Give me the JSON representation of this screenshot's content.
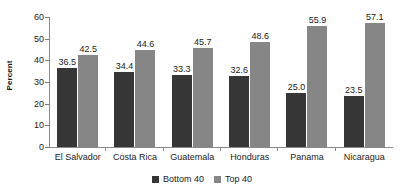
{
  "chart_data": {
    "type": "bar",
    "title": "",
    "subtitle": "",
    "xlabel": "",
    "ylabel": "Percent",
    "ylim": [
      0,
      60
    ],
    "yticks": [
      0,
      10,
      20,
      30,
      40,
      50,
      60
    ],
    "grid": false,
    "legend_position": "bottom",
    "categories": [
      "El Salvador",
      "Costa Rica",
      "Guatemala",
      "Honduras",
      "Panama",
      "Nicaragua"
    ],
    "series": [
      {
        "name": "Bottom 40",
        "color": "#363636",
        "values": [
          36.5,
          34.4,
          33.3,
          32.6,
          25.0,
          23.5
        ],
        "labels": [
          "36.5",
          "34.4",
          "33.3",
          "32.6",
          "25.0",
          "23.5"
        ]
      },
      {
        "name": "Top 40",
        "color": "#868686",
        "values": [
          42.5,
          44.6,
          45.7,
          48.6,
          55.9,
          57.1
        ],
        "labels": [
          "42.5",
          "44.6",
          "45.7",
          "48.6",
          "55.9",
          "57.1"
        ]
      }
    ]
  },
  "axes": {
    "y_title": "Percent",
    "y_tick_labels": [
      "60",
      "50",
      "40",
      "30",
      "20",
      "10",
      "0"
    ]
  },
  "legend": {
    "items": [
      {
        "label": "Bottom 40"
      },
      {
        "label": "Top 40"
      }
    ]
  }
}
